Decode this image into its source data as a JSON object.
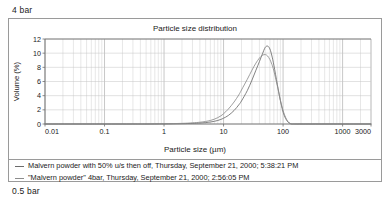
{
  "top_label": "4 bar",
  "bottom_label": "0.5 bar",
  "panel": {
    "title": "Particle size distribution",
    "x_axis_title": "Particle size (µm)",
    "y_axis_title": "Volume (%)"
  },
  "legend": {
    "entries": [
      {
        "marker": "line-dash-icon",
        "label": "Malvern powder with 50% u/s then off, Thursday, September 21, 2000; 5:38:21 PM",
        "color": "#6b6b6b"
      },
      {
        "marker": "line-dash-icon",
        "label": "\"Malvern powder\" 4bar, Thursday, September 21, 2000; 2:56:05 PM",
        "color": "#8c8c8c"
      }
    ]
  },
  "chart_data": {
    "type": "line",
    "title": "Particle size distribution",
    "xlabel": "Particle size (µm)",
    "ylabel": "Volume (%)",
    "xscale": "log",
    "xlim": [
      0.01,
      3000
    ],
    "ylim": [
      0,
      12
    ],
    "xticks": [
      0.01,
      0.1,
      1,
      10,
      100,
      1000,
      3000
    ],
    "xtick_labels": [
      "0.01",
      "0.1",
      "1",
      "10",
      "100",
      "1000",
      "3000"
    ],
    "yticks": [
      0,
      2,
      4,
      6,
      8,
      10,
      12
    ],
    "ytick_labels": [
      "0",
      "2",
      "4",
      "6",
      "8",
      "10",
      "12"
    ],
    "grid": "log-minor-vertical-and-major-horizontal",
    "legend_position": "below-plot",
    "x": [
      0.01,
      0.05,
      0.1,
      0.3,
      0.5,
      1,
      2,
      3,
      4,
      5,
      6,
      7,
      8,
      9,
      10,
      12,
      15,
      18,
      20,
      25,
      30,
      35,
      40,
      45,
      50,
      55,
      60,
      65,
      70,
      80,
      90,
      100,
      110,
      120,
      130,
      140,
      150,
      200,
      500,
      1000,
      3000
    ],
    "series": [
      {
        "name": "Malvern powder with 50% u/s then off, Thursday, September 21, 2000; 5:38:21 PM",
        "color": "#6b6b6b",
        "values": [
          0,
          0,
          0,
          0,
          0,
          0.02,
          0.05,
          0.09,
          0.14,
          0.2,
          0.28,
          0.38,
          0.5,
          0.65,
          0.82,
          1.2,
          1.9,
          2.7,
          3.25,
          4.7,
          6.2,
          7.6,
          8.8,
          9.9,
          10.8,
          11.0,
          10.6,
          9.6,
          8.3,
          5.6,
          3.3,
          1.7,
          0.8,
          0.3,
          0.08,
          0.0,
          0,
          0,
          0,
          0,
          0
        ]
      },
      {
        "name": "\"Malvern powder\" 4bar, Thursday, September 21, 2000; 2:56:05 PM",
        "color": "#8c8c8c",
        "values": [
          0,
          0,
          0,
          0,
          0,
          0.03,
          0.09,
          0.16,
          0.25,
          0.36,
          0.5,
          0.68,
          0.9,
          1.15,
          1.45,
          2.1,
          3.1,
          4.1,
          4.8,
          6.3,
          7.6,
          8.6,
          9.3,
          9.7,
          9.8,
          9.6,
          9.1,
          8.4,
          7.5,
          5.4,
          3.4,
          1.9,
          0.95,
          0.38,
          0.1,
          0.0,
          0,
          0,
          0,
          0,
          0
        ]
      }
    ]
  }
}
